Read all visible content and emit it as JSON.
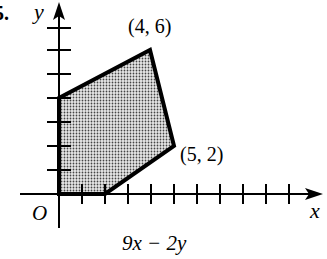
{
  "problem_number": "5.",
  "axes": {
    "x_label": "x",
    "y_label": "y",
    "origin_label": "O",
    "x_ticks": 11,
    "y_ticks": 7
  },
  "region": {
    "vertices": [
      [
        0,
        0
      ],
      [
        0,
        4
      ],
      [
        4,
        6
      ],
      [
        5,
        2
      ],
      [
        2,
        0
      ]
    ],
    "fill": "stippled gray"
  },
  "vertex_labels": [
    {
      "text": "(4, 6)",
      "point": [
        4,
        6
      ]
    },
    {
      "text": "(5, 2)",
      "point": [
        5,
        2
      ]
    }
  ],
  "objective": "9x − 2y"
}
